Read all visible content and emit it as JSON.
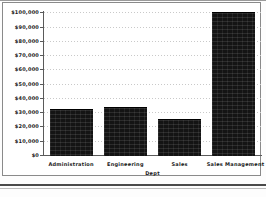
{
  "chart_data": {
    "type": "bar",
    "title": "",
    "xlabel": "Dept",
    "ylabel": "",
    "categories": [
      "Administration",
      "Engineering",
      "Sales",
      "Sales Management"
    ],
    "values": [
      32400,
      33400,
      25200,
      100000
    ],
    "ylim": [
      0,
      100000
    ],
    "ytick_values": [
      0,
      10000,
      20000,
      30000,
      40000,
      50000,
      60000,
      70000,
      80000,
      90000,
      100000
    ],
    "ytick_labels": [
      "$0",
      "$10,000",
      "$20,000",
      "$30,000",
      "$40,000",
      "$50,000",
      "$60,000",
      "$70,000",
      "$80,000",
      "$90,000",
      "$100,000"
    ],
    "grid": true,
    "legend": false,
    "bar_color": "#141414",
    "axis_color": "#5a5a5a",
    "grid_color": "#c9c9c9",
    "text_color": "#1a1a1a"
  }
}
